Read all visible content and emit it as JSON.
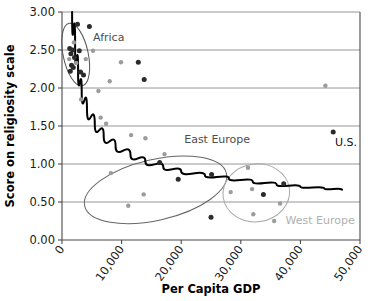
{
  "chart_data": {
    "type": "scatter",
    "title": "",
    "xlabel": "Per Capita GDP",
    "ylabel": "Score on religiosity scale",
    "xlim": [
      0,
      50000
    ],
    "ylim": [
      0.0,
      3.0
    ],
    "grid": "horizontal",
    "legend": "none",
    "xticks": [
      0,
      10000,
      20000,
      30000,
      40000,
      50000
    ],
    "xtick_labels": [
      "0",
      "10,000",
      "20,000",
      "30,000",
      "40,000",
      "50,000"
    ],
    "yticks": [
      0.0,
      0.5,
      1.0,
      1.5,
      2.0,
      2.5,
      3.0
    ],
    "ytick_labels": [
      "0.00",
      "0.50",
      "1.00",
      "1.50",
      "2.00",
      "2.50",
      "3.00"
    ],
    "series": [
      {
        "name": "countries-dark",
        "color": "#2b2b2b",
        "points": [
          [
            1300,
            2.52
          ],
          [
            1500,
            2.45
          ],
          [
            1800,
            2.5
          ],
          [
            1600,
            2.3
          ],
          [
            1400,
            2.22
          ],
          [
            1900,
            2.27
          ],
          [
            2100,
            2.4
          ],
          [
            2600,
            2.84
          ],
          [
            2900,
            2.49
          ],
          [
            3100,
            2.21
          ],
          [
            3600,
            2.17
          ],
          [
            4600,
            2.81
          ],
          [
            12800,
            2.34
          ],
          [
            13800,
            2.11
          ],
          [
            16400,
            1.02
          ],
          [
            19500,
            0.8
          ],
          [
            25100,
            0.86
          ],
          [
            25000,
            0.3
          ],
          [
            33800,
            0.6
          ],
          [
            37200,
            0.74
          ],
          [
            45500,
            1.42
          ]
        ]
      },
      {
        "name": "countries-light",
        "color": "#9b9b9b",
        "points": [
          [
            1200,
            2.38
          ],
          [
            2000,
            2.6
          ],
          [
            2400,
            2.33
          ],
          [
            3200,
            1.85
          ],
          [
            4000,
            2.38
          ],
          [
            5200,
            2.49
          ],
          [
            6100,
            1.96
          ],
          [
            6500,
            1.61
          ],
          [
            7400,
            1.53
          ],
          [
            8000,
            2.09
          ],
          [
            8200,
            0.88
          ],
          [
            9900,
            2.34
          ],
          [
            11100,
            0.45
          ],
          [
            11600,
            1.38
          ],
          [
            13700,
            0.6
          ],
          [
            14000,
            1.34
          ],
          [
            17200,
            1.13
          ],
          [
            31200,
            0.95
          ],
          [
            28300,
            0.63
          ],
          [
            31900,
            0.67
          ],
          [
            32100,
            0.34
          ],
          [
            35600,
            0.25
          ],
          [
            36600,
            0.48
          ],
          [
            44200,
            2.03
          ]
        ]
      }
    ],
    "trend_line": {
      "name": "logarithmic-trend",
      "color": "#000000",
      "description": "declining power/log curve",
      "points": [
        [
          1700,
          3.0
        ],
        [
          2200,
          2.55
        ],
        [
          2700,
          2.2
        ],
        [
          3300,
          1.95
        ],
        [
          4200,
          1.72
        ],
        [
          5500,
          1.52
        ],
        [
          7000,
          1.37
        ],
        [
          9000,
          1.23
        ],
        [
          11500,
          1.12
        ],
        [
          14000,
          1.03
        ],
        [
          17000,
          0.96
        ],
        [
          20000,
          0.9
        ],
        [
          24000,
          0.85
        ],
        [
          28000,
          0.81
        ],
        [
          32000,
          0.77
        ],
        [
          36000,
          0.73
        ],
        [
          40000,
          0.7
        ],
        [
          44000,
          0.68
        ],
        [
          47000,
          0.66
        ]
      ]
    },
    "annotations": [
      {
        "name": "africa",
        "label": "Africa",
        "x": 5200,
        "y": 2.62,
        "color": "#4d4d4d"
      },
      {
        "name": "east-europe",
        "label": "East Europe",
        "x": 20500,
        "y": 1.28,
        "color": "#4d4d4d"
      },
      {
        "name": "west-europe",
        "label": "West Europe",
        "x": 37500,
        "y": 0.21,
        "color": "#b0b0b0"
      },
      {
        "name": "us",
        "label": "U.S.",
        "x": 45800,
        "y": 1.24,
        "color": "#111111"
      }
    ],
    "clusters": [
      {
        "name": "africa-ellipse",
        "cx": 2300,
        "cy": 2.44,
        "rx": 2100,
        "ry": 0.42,
        "rotation": -12,
        "color": "#555555"
      },
      {
        "name": "east-europe-ellipse",
        "cx": 15700,
        "cy": 0.66,
        "rx": 12200,
        "ry": 0.4,
        "rotation": -13,
        "color": "#666666"
      },
      {
        "name": "west-europe-ellipse",
        "cx": 32600,
        "cy": 0.62,
        "rx": 5600,
        "ry": 0.38,
        "rotation": -8,
        "color": "#a8a8a8"
      }
    ]
  }
}
